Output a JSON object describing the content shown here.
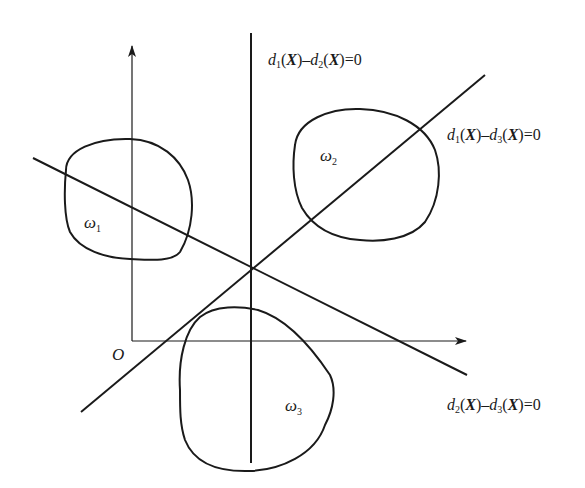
{
  "figure": {
    "origin_label": "O",
    "classes": [
      {
        "symbol": "ω",
        "index": "1"
      },
      {
        "symbol": "ω",
        "index": "2"
      },
      {
        "symbol": "ω",
        "index": "3"
      }
    ],
    "boundaries": [
      {
        "a_fn": "d",
        "a_idx": "1",
        "b_fn": "d",
        "b_idx": "2",
        "arg": "X",
        "equals": "=0"
      },
      {
        "a_fn": "d",
        "a_idx": "1",
        "b_fn": "d",
        "b_idx": "3",
        "arg": "X",
        "equals": "=0"
      },
      {
        "a_fn": "d",
        "a_idx": "2",
        "b_fn": "d",
        "b_idx": "3",
        "arg": "X",
        "equals": "=0"
      }
    ],
    "colors": {
      "stroke": "#1a1a1a",
      "background": "#ffffff"
    }
  }
}
